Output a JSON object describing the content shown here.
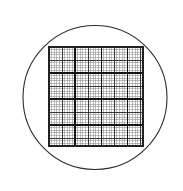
{
  "figure": {
    "title": "Microscope eyepiece reticle with square counting grid",
    "type": "line-drawing",
    "background_color": "#ffffff",
    "width": 183,
    "height": 191
  },
  "field_of_view": {
    "name": "circular field of view",
    "shape": "circle",
    "center_x": 95,
    "center_y": 97.5,
    "radius": 72,
    "stroke_color": "#2b2b2b",
    "stroke_width": 1.1,
    "fill": "none"
  },
  "grid": {
    "name": "counting grid",
    "shape": "square",
    "left": 49,
    "top": 47,
    "right": 143,
    "bottom": 146,
    "width": 94,
    "height": 99,
    "border_color": "#222222",
    "border_width": 1.3,
    "fine": {
      "label": "fine grid lines",
      "columns": 36,
      "rows": 38,
      "cell_width": 2.611,
      "cell_height": 2.605,
      "stroke_color": "#8a8a8a",
      "stroke_width": 0.55
    },
    "major": {
      "label": "major grid lines",
      "interval_cells": 5,
      "stroke_color": "#2e2e2e",
      "stroke_width": 0.95
    },
    "heavy": {
      "label": "heavy division lines",
      "interval_cells": 10,
      "stroke_color": "#141414",
      "stroke_width": 1.35,
      "vertical_positions_cells": [
        0,
        10,
        20,
        30,
        36
      ],
      "horizontal_positions_cells": [
        0,
        10,
        20,
        30,
        38
      ]
    }
  },
  "colors": {
    "ink": "#1a1a1a",
    "mid_ink": "#2e2e2e",
    "light_ink": "#8a8a8a",
    "paper": "#ffffff"
  }
}
